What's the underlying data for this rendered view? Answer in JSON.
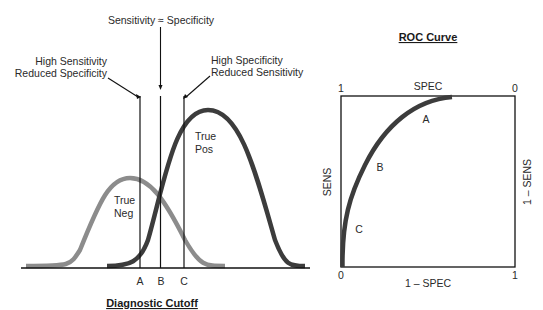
{
  "left_panel": {
    "title": "Diagnostic Cutoff",
    "top_label": "Sensitivity ≈ Specificity",
    "left_annotation": [
      "High Sensitivity",
      "Reduced Specificity"
    ],
    "right_annotation": [
      "High Specificity",
      "Reduced Sensitivity"
    ],
    "neg_label": [
      "True",
      "Neg"
    ],
    "pos_label": [
      "True",
      "Pos"
    ],
    "cutoffs": [
      "A",
      "B",
      "C"
    ],
    "colors": {
      "neg_curve": "#8c8c8c",
      "pos_curve": "#3c3c3c",
      "lines": "#111111"
    }
  },
  "right_panel": {
    "title": "ROC Curve",
    "top_axis_label": "SPEC",
    "bottom_axis_label": "1 – SPEC",
    "left_axis_label": "SENS",
    "right_axis_label": "1 – SENS",
    "top_left_tick": "1",
    "top_right_tick": "0",
    "bottom_left_tick": "0",
    "bottom_right_tick": "1",
    "point_labels": [
      "A",
      "B",
      "C"
    ],
    "colors": {
      "curve": "#3c3c3c",
      "frame": "#111111"
    }
  }
}
